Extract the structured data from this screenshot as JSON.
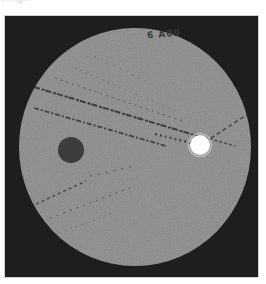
{
  "image": {
    "description": "CT phantom scan slice with dark and bright cylindrical inserts and streak artifacts",
    "caption_partial": "·····ᴅ··",
    "phantom_label": "6 A09",
    "colors": {
      "background": "#1e1e1e",
      "phantom_body": "#8b8b8b",
      "dark_insert": "#3c3c3c",
      "bright_insert": "#ffffff",
      "streak": "#2e2e2e"
    }
  }
}
